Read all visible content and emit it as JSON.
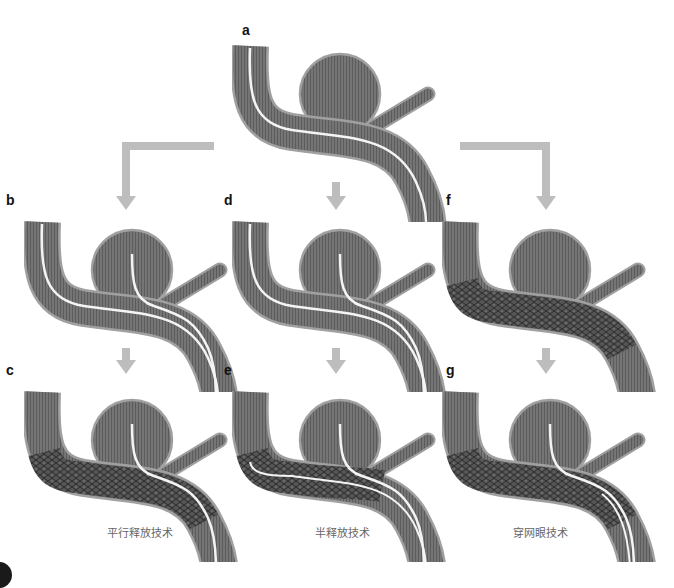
{
  "figure": {
    "panels": [
      {
        "id": "a",
        "label": "a",
        "state": "microcatheter in parent artery",
        "x": 232,
        "y": 22
      },
      {
        "id": "b",
        "label": "b",
        "state": "two microcatheters, one in aneurysm",
        "x": 24,
        "y": 192
      },
      {
        "id": "c",
        "label": "c",
        "state": "stent deployed over parent artery, coil catheter jailed",
        "x": 24,
        "y": 362
      },
      {
        "id": "d",
        "label": "d",
        "state": "two microcatheters, one in aneurysm",
        "x": 232,
        "y": 192
      },
      {
        "id": "e",
        "label": "e",
        "state": "stent half deployed",
        "x": 232,
        "y": 362
      },
      {
        "id": "f",
        "label": "f",
        "state": "stent deployed first",
        "x": 442,
        "y": 192
      },
      {
        "id": "g",
        "label": "g",
        "state": "catheter passed through stent mesh",
        "x": 442,
        "y": 362
      }
    ],
    "captions": {
      "c": "平行释放技术",
      "e": "半释放技术",
      "g": "穿网眼技术"
    },
    "colors": {
      "vessel": "#6e6e6e",
      "vessel_edge": "#9a9a9a",
      "vessel_stripe": "#5a5a5a",
      "catheter": "#f4f4f4",
      "stent": "#4a4a4a",
      "arrow": "#bdbdbd",
      "label": "#111111",
      "caption": "#666666"
    }
  }
}
